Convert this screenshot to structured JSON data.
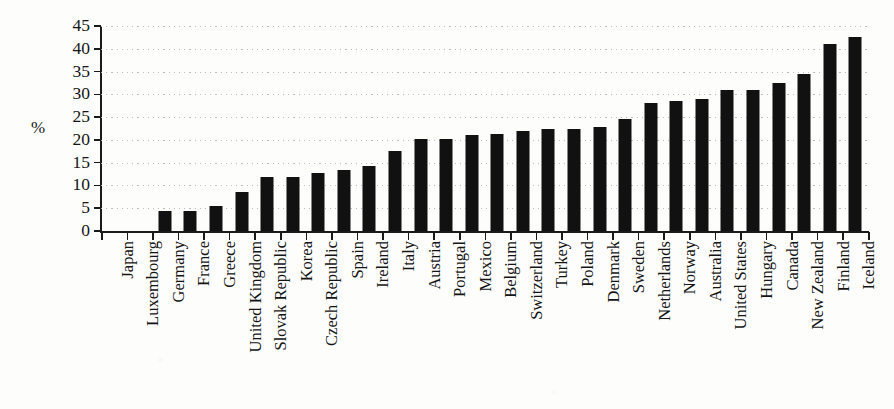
{
  "chart_data": {
    "type": "bar",
    "title": "",
    "xlabel": "",
    "ylabel": "%",
    "ylim": [
      0,
      45
    ],
    "ytick_step": 5,
    "yticks": [
      "0",
      "5",
      "10",
      "15",
      "20",
      "25",
      "30",
      "35",
      "40",
      "45"
    ],
    "grid": true,
    "grid_style": "dotted-horizontal",
    "legend": "none",
    "bar_color": "#111111",
    "categories": [
      "Japan",
      "Luxembourg",
      "Germany",
      "France",
      "Greece",
      "United Kingdom",
      "Slovak Republic",
      "Korea",
      "Czech Republic",
      "Spain",
      "Ireland",
      "Italy",
      "Austria",
      "Portugal",
      "Mexico",
      "Belgium",
      "Switzerland",
      "Turkey",
      "Poland",
      "Denmark",
      "Sweden",
      "Netherlands",
      "Norway",
      "Australia",
      "United States",
      "Hungary",
      "Canada",
      "New Zealand",
      "Finland",
      "Iceland"
    ],
    "values": [
      0,
      0,
      4.5,
      4.5,
      5.5,
      8.5,
      11.8,
      11.8,
      12.8,
      13.4,
      14.3,
      17.6,
      20.1,
      20.1,
      21,
      21.4,
      22,
      22.5,
      22.5,
      22.8,
      24.5,
      28,
      28.5,
      29,
      31,
      31,
      32.6,
      34.5,
      41,
      42.5
    ]
  },
  "axis": {
    "y_label_text": "%"
  }
}
